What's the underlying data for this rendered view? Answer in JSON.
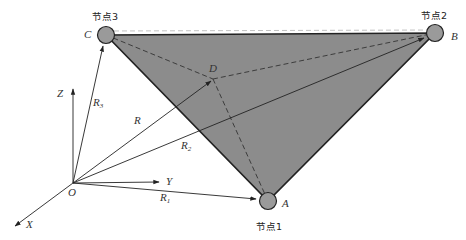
{
  "diagram": {
    "nodes": [
      {
        "id": "A",
        "label": "A",
        "caption": "节点1",
        "x": 268,
        "y": 201
      },
      {
        "id": "B",
        "label": "B",
        "caption": "节点2",
        "x": 435,
        "y": 33
      },
      {
        "id": "C",
        "label": "C",
        "caption": "节点3",
        "x": 106,
        "y": 35
      }
    ],
    "point_D": {
      "label": "D",
      "x": 213,
      "y": 79
    },
    "origin": {
      "label": "O",
      "x": 73,
      "y": 183
    },
    "axes": {
      "x": "X",
      "y": "Y",
      "z": "Z"
    },
    "vectors": {
      "r": "R",
      "r1": "R",
      "r1_sub": "1",
      "r2": "R",
      "r2_sub": "2",
      "r3": "R",
      "r3_sub": "3"
    },
    "colors": {
      "triangle_fill": "#8c8c8c",
      "node_fill": "#9a9a9a",
      "stroke": "#222222"
    }
  }
}
